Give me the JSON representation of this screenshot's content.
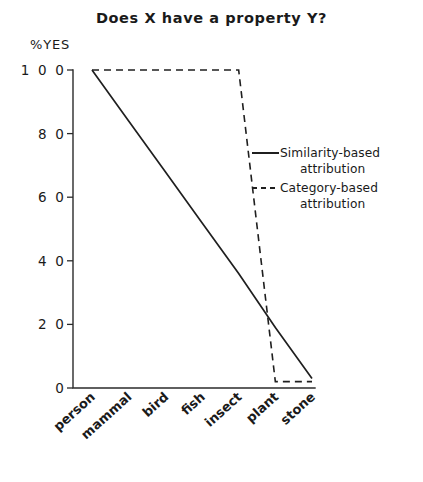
{
  "chart_data": {
    "type": "line",
    "title": "Does X have a property Y?",
    "xlabel": "",
    "ylabel": "%YES",
    "ylim": [
      0,
      100
    ],
    "yticks": [
      0,
      20,
      40,
      60,
      80,
      100
    ],
    "ytick_labels": [
      "0",
      "2 0",
      "4 0",
      "6 0",
      "8 0",
      "1 0 0"
    ],
    "grid": false,
    "legend_position": "center-right",
    "categories": [
      "person",
      "mammal",
      "bird",
      "fish",
      "insect",
      "plant",
      "stone"
    ],
    "series": [
      {
        "name": "Similarity-based attribution",
        "style": "solid",
        "values": [
          100,
          84,
          68,
          52,
          36,
          19,
          3
        ]
      },
      {
        "name": "Category-based attribution",
        "style": "dashed",
        "values": [
          100,
          100,
          100,
          100,
          100,
          2,
          2
        ]
      }
    ],
    "legend": [
      {
        "label_line1": "Similarity-based",
        "label_line2": "attribution",
        "style": "solid"
      },
      {
        "label_line1": "Category-based",
        "label_line2": "attribution",
        "style": "dashed"
      }
    ]
  },
  "colors": {
    "ink": "#1f1f1f",
    "axis": "#2b2b2b",
    "background": "#ffffff"
  }
}
